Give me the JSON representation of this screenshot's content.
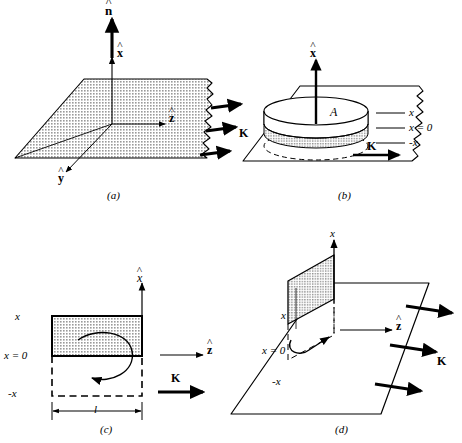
{
  "figure": {
    "background_color": "#ffffff",
    "ink_color": "#000000",
    "shade_color": "#b0b0b0"
  },
  "panels": [
    {
      "id": "a",
      "caption": "(a)",
      "description": "Infinite current sheet in the y-z plane with unit normal vector",
      "labels": {
        "normal": "n",
        "x_hat": "x",
        "y_hat": "y",
        "z_hat": "z",
        "current": "K"
      },
      "arrow_count_current": 3
    },
    {
      "id": "b",
      "caption": "(b)",
      "description": "Gaussian pillbox of area A straddling the sheet",
      "labels": {
        "x_hat": "x",
        "area": "A",
        "above": "x",
        "surface": "x = 0",
        "below": "-x",
        "current": "K"
      }
    },
    {
      "id": "c",
      "caption": "(c)",
      "description": "Amperian rectangular loop of length l seen edge-on, straddling the sheet",
      "labels": {
        "x_hat": "x",
        "above": "x",
        "surface": "x = 0",
        "below": "-x",
        "length": "l",
        "z_hat": "z",
        "current": "K"
      }
    },
    {
      "id": "d",
      "caption": "(d)",
      "description": "Perspective view of the Amperian loop standing perpendicular to the sheet",
      "labels": {
        "x_axis": "x",
        "above": "x",
        "surface": "x = 0",
        "below": "-x",
        "z_hat": "z",
        "current": "K"
      },
      "arrow_count_current": 3
    }
  ]
}
